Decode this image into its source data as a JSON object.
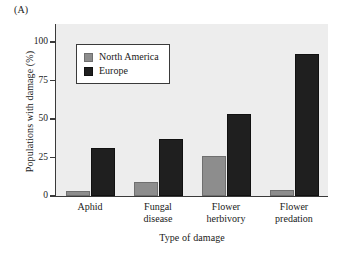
{
  "panel_label": "(A)",
  "chart_data": {
    "type": "bar",
    "title": "",
    "xlabel": "Type of damage",
    "ylabel": "Populations with damage (%)",
    "categories": [
      "Aphid",
      "Fungal\ndisease",
      "Flower\nherbivory",
      "Flower\npredation"
    ],
    "category_labels_flat": [
      "Aphid",
      "Fungal disease",
      "Flower herbivory",
      "Flower predation"
    ],
    "series": [
      {
        "name": "North America",
        "color": "#8d8d8d",
        "values": [
          3,
          9,
          26,
          4
        ]
      },
      {
        "name": "Europe",
        "color": "#1f1f1f",
        "values": [
          31,
          37,
          53,
          92
        ]
      }
    ],
    "ylim": [
      0,
      100
    ],
    "yticks": [
      0,
      25,
      50,
      75,
      100
    ],
    "ytick_labels": [
      "0",
      "25",
      "50",
      "75",
      "100"
    ],
    "grid": false,
    "legend_position": "upper-left-inside",
    "plot_background": "#ededed"
  },
  "legend": {
    "entries": [
      {
        "label": "North America",
        "swatch": "na"
      },
      {
        "label": "Europe",
        "swatch": "eu"
      }
    ]
  }
}
